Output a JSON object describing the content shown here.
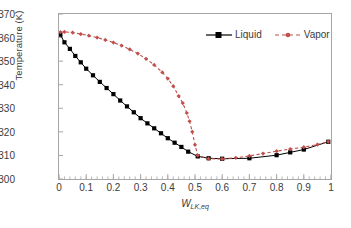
{
  "chart_data": {
    "type": "line",
    "title": "",
    "xlabel": "W",
    "xlabel_sub": "LK,eq",
    "ylabel": "Temperature (K)",
    "xlim": [
      0,
      1
    ],
    "ylim": [
      300,
      370
    ],
    "xticks": [
      "0",
      "0.1",
      "0.2",
      "0.3",
      "0.4",
      "0.5",
      "0.6",
      "0.7",
      "0.8",
      "0.9",
      "1"
    ],
    "yticks": [
      "300",
      "310",
      "320",
      "330",
      "340",
      "350",
      "360",
      "370"
    ],
    "x_minor_tick_step": 0.02,
    "grid": false,
    "legend_position": "top-right",
    "series": [
      {
        "name": "Liquid",
        "color": "#000000",
        "style": "solid",
        "marker": "square",
        "x": [
          0.005,
          0.02,
          0.04,
          0.06,
          0.08,
          0.1,
          0.125,
          0.15,
          0.175,
          0.2,
          0.225,
          0.25,
          0.275,
          0.3,
          0.325,
          0.35,
          0.375,
          0.4,
          0.425,
          0.45,
          0.475,
          0.51,
          0.55,
          0.6,
          0.7,
          0.8,
          0.85,
          0.9,
          0.99
        ],
        "y": [
          361.2,
          358.0,
          355.2,
          352.2,
          349.5,
          346.8,
          344.0,
          341.2,
          338.6,
          336.0,
          333.3,
          330.8,
          328.3,
          325.8,
          323.6,
          321.5,
          319.4,
          317.3,
          315.4,
          313.6,
          311.6,
          309.6,
          308.8,
          308.6,
          308.8,
          310.1,
          311.3,
          312.5,
          315.8
        ]
      },
      {
        "name": "Vapor",
        "color": "#C0504D",
        "style": "dashed",
        "marker": "small-diamond",
        "x": [
          0.005,
          0.02,
          0.05,
          0.08,
          0.11,
          0.14,
          0.17,
          0.2,
          0.23,
          0.26,
          0.29,
          0.32,
          0.35,
          0.38,
          0.4,
          0.42,
          0.44,
          0.455,
          0.47,
          0.48,
          0.49,
          0.5,
          0.51,
          0.55,
          0.6,
          0.65,
          0.7,
          0.75,
          0.8,
          0.85,
          0.9,
          0.95,
          0.99
        ],
        "y": [
          362.3,
          362.4,
          362.1,
          361.5,
          360.8,
          360.0,
          359.0,
          357.9,
          356.6,
          355.0,
          353.2,
          351.0,
          348.4,
          345.2,
          342.6,
          339.4,
          335.2,
          332.2,
          328.0,
          324.5,
          320.0,
          314.5,
          310.0,
          308.6,
          308.5,
          309.0,
          309.8,
          310.8,
          311.8,
          312.7,
          313.5,
          314.6,
          315.9
        ]
      }
    ]
  },
  "legend": {
    "liquid_label": "Liquid",
    "vapor_label": "Vapor"
  },
  "colors": {
    "liquid": "#000000",
    "vapor": "#C0504D",
    "frame": "#a6a6a6",
    "text": "#3b3b3b",
    "background": "#ffffff"
  }
}
